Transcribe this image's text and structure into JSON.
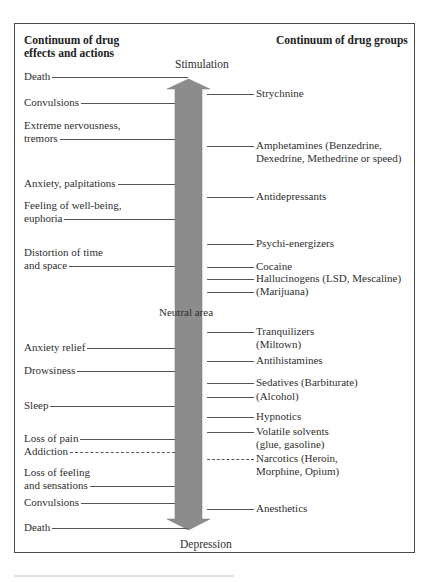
{
  "headers": {
    "left": [
      "Continuum of drug",
      "effects and actions"
    ],
    "right": "Continuum of drug groups"
  },
  "axis": {
    "top": "Stimulation",
    "middle": "Neutral area",
    "bottom": "Depression",
    "arrow_color": "#8c8c8c"
  },
  "effects": [
    {
      "lines": [
        "Death"
      ],
      "y": 70,
      "line_to": "arrow-tip"
    },
    {
      "lines": [
        "Convulsions"
      ],
      "y": 96
    },
    {
      "lines": [
        "Extreme nervousness,",
        "tremors"
      ],
      "y": 119
    },
    {
      "lines": [
        "Anxiety, palpitations"
      ],
      "y": 177
    },
    {
      "lines": [
        "Feeling of well-being,",
        "euphoria"
      ],
      "y": 199
    },
    {
      "lines": [
        "Distortion of time",
        "and space"
      ],
      "y": 246
    },
    {
      "lines": [
        "Anxiety relief"
      ],
      "y": 341
    },
    {
      "lines": [
        "Drowsiness"
      ],
      "y": 364
    },
    {
      "lines": [
        "Sleep"
      ],
      "y": 399
    },
    {
      "lines": [
        "Loss of pain"
      ],
      "y": 432
    },
    {
      "lines": [
        "Addiction"
      ],
      "y": 445,
      "dashed": true
    },
    {
      "lines": [
        "Loss of feeling",
        "and sensations"
      ],
      "y": 466
    },
    {
      "lines": [
        "Convulsions"
      ],
      "y": 496
    },
    {
      "lines": [
        "Death"
      ],
      "y": 521,
      "line_to": "arrow-tip"
    }
  ],
  "drug_groups": [
    {
      "lines": [
        "Strychnine"
      ],
      "y": 87
    },
    {
      "lines": [
        "Amphetamines (Benzedrine,",
        "Dexedrine, Methedrine or speed)"
      ],
      "y": 139
    },
    {
      "lines": [
        "Antidepressants"
      ],
      "y": 190
    },
    {
      "lines": [
        "Psychi-energizers"
      ],
      "y": 237
    },
    {
      "lines": [
        "Cocaine"
      ],
      "y": 260
    },
    {
      "lines": [
        "Hallucinogens (LSD, Mescaline)"
      ],
      "y": 272
    },
    {
      "lines": [
        "(Marijuana)"
      ],
      "y": 285
    },
    {
      "lines": [
        "Tranquilizers",
        "(Miltown)"
      ],
      "y": 325
    },
    {
      "lines": [
        "Antihistamines"
      ],
      "y": 354
    },
    {
      "lines": [
        "Sedatives (Barbiturate)"
      ],
      "y": 376
    },
    {
      "lines": [
        "(Alcohol)"
      ],
      "y": 390
    },
    {
      "lines": [
        "Hypnotics"
      ],
      "y": 410
    },
    {
      "lines": [
        "Volatile solvents",
        "(glue, gasoline)"
      ],
      "y": 425
    },
    {
      "lines": [
        "Narcotics (Heroin,",
        "Morphine, Opium)"
      ],
      "y": 452,
      "dashed": true
    },
    {
      "lines": [
        "Anesthetics"
      ],
      "y": 502
    }
  ]
}
